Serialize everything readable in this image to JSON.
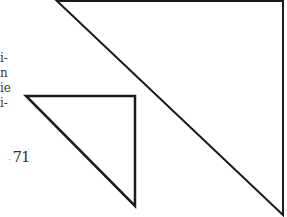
{
  "text_fragments": [
    {
      "text": "i-",
      "x": 0,
      "y": 52
    },
    {
      "text": "n",
      "x": 0,
      "y": 67
    },
    {
      "text": "ie",
      "x": 0,
      "y": 82
    },
    {
      "text": "i-",
      "x": 0,
      "y": 97
    }
  ],
  "page_number": "71",
  "figure": {
    "stroke_color": "#1a1a1a",
    "large_triangle": {
      "points": [
        [
          57,
          1
        ],
        [
          283,
          1
        ],
        [
          283,
          215
        ]
      ],
      "stroke_width": 2
    },
    "small_triangle": {
      "points": [
        [
          26,
          96
        ],
        [
          135,
          96
        ],
        [
          135,
          206
        ]
      ],
      "stroke_width": 2.5
    }
  }
}
